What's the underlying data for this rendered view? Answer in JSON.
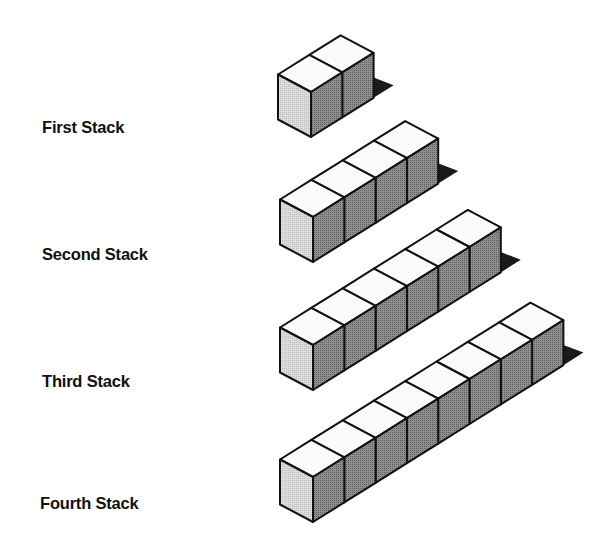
{
  "diagram": {
    "title": "",
    "colors": {
      "background": "#ffffff",
      "stroke": "#111111",
      "top_face": "#fbfbfb",
      "left_face": "#dcdcdc",
      "right_face": "#8f8f8f",
      "shadow": "#1a1a1a"
    },
    "geometry": {
      "step_x": 31.3,
      "step_y": -19.6,
      "left_dx": -33,
      "left_dy": -17.5,
      "height": 45
    },
    "stacks": [
      {
        "label": "First Stack",
        "cubes": 2,
        "front_top": [
          311,
          92
        ],
        "label_pos": [
          42,
          118
        ]
      },
      {
        "label": "Second Stack",
        "cubes": 4,
        "front_top": [
          313,
          217
        ],
        "label_pos": [
          42,
          245
        ]
      },
      {
        "label": "Third Stack",
        "cubes": 6,
        "front_top": [
          313,
          345
        ],
        "label_pos": [
          42,
          372
        ]
      },
      {
        "label": "Fourth Stack",
        "cubes": 8,
        "front_top": [
          313,
          477
        ],
        "label_pos": [
          40,
          494
        ]
      }
    ]
  }
}
